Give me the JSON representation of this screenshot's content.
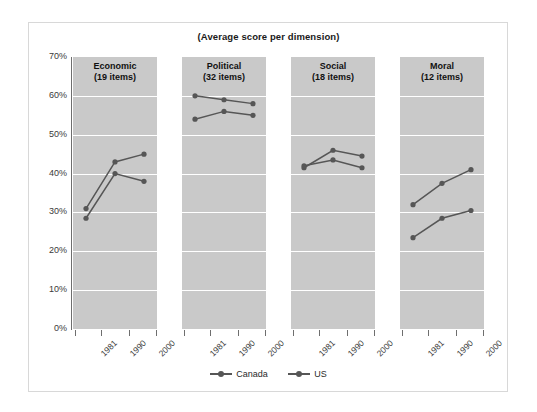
{
  "chart_data": {
    "type": "line",
    "title": "(Average score per dimension)",
    "xlabel": "",
    "ylabel": "",
    "ylim": [
      0,
      70
    ],
    "ytick_labels": [
      "0%",
      "10%",
      "20%",
      "30%",
      "40%",
      "50%",
      "60%",
      "70%"
    ],
    "ytick_values": [
      0,
      10,
      20,
      30,
      40,
      50,
      60,
      70
    ],
    "grid": true,
    "legend_position": "bottom",
    "x": [
      "1981",
      "1990",
      "2000"
    ],
    "panels": [
      {
        "name": "Economic",
        "items_label": "(19 items)",
        "series": [
          {
            "name": "Canada",
            "values": [
              31.0,
              43.0,
              45.0
            ]
          },
          {
            "name": "US",
            "values": [
              28.5,
              40.0,
              38.0
            ]
          }
        ]
      },
      {
        "name": "Political",
        "items_label": "(32 items)",
        "series": [
          {
            "name": "Canada",
            "values": [
              60.0,
              59.0,
              58.0
            ]
          },
          {
            "name": "US",
            "values": [
              54.0,
              56.0,
              55.0
            ]
          }
        ]
      },
      {
        "name": "Social",
        "items_label": "(18 items)",
        "series": [
          {
            "name": "Canada",
            "values": [
              41.5,
              46.0,
              44.5
            ]
          },
          {
            "name": "US",
            "values": [
              42.0,
              43.5,
              41.5
            ]
          }
        ]
      },
      {
        "name": "Moral",
        "items_label": "(12 items)",
        "series": [
          {
            "name": "Canada",
            "values": [
              32.0,
              37.5,
              41.0
            ]
          },
          {
            "name": "US",
            "values": [
              23.5,
              28.5,
              30.5
            ]
          }
        ]
      }
    ],
    "legend": [
      {
        "label": "Canada",
        "color": "#565656"
      },
      {
        "label": "US",
        "color": "#565656"
      }
    ],
    "colors": {
      "panel_background": "#c9c9c9",
      "gridline": "#ffffff",
      "series": "#565656",
      "axis": "#6e6e6e",
      "text": "#1a1a1a",
      "frame_border": "#d8d8d8",
      "page_background": "#ffffff"
    }
  }
}
